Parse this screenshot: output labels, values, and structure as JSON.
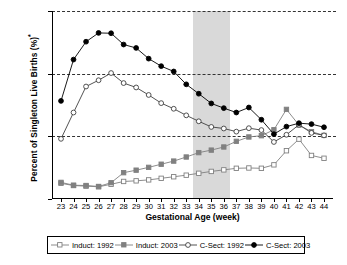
{
  "chart_data": {
    "type": "line",
    "title": "",
    "xlabel": "Gestational Age (week)",
    "ylabel": "Percent of Singleton Live Births (%)*",
    "ylabel_base": "Percent of Singleton Live Births (%)",
    "ylabel_footnote_marker": "*",
    "xlim": [
      23,
      44
    ],
    "ylim": [
      0,
      60
    ],
    "ytick_labels": [
      "0%",
      "20%",
      "40%",
      "60%"
    ],
    "ytick_values": [
      0,
      20,
      40,
      60
    ],
    "grid": "horizontal-dashed",
    "legend_position": "bottom",
    "categories": [
      23,
      24,
      25,
      26,
      27,
      28,
      29,
      30,
      31,
      32,
      33,
      34,
      35,
      36,
      37,
      38,
      39,
      40,
      41,
      42,
      43,
      44
    ],
    "xtick_labels": [
      "23",
      "24",
      "25",
      "26",
      "27",
      "28",
      "29",
      "30",
      "31",
      "32",
      "33",
      "34",
      "35",
      "36",
      "37",
      "38",
      "39",
      "40",
      "41",
      "42",
      "43",
      "44"
    ],
    "annotations": [
      {
        "name": "late-preterm-shaded-band",
        "type": "vertical-band",
        "x_start": 33.5,
        "x_end": 36.5,
        "color": "#d9d9d9"
      }
    ],
    "series": [
      {
        "name": "Induct: 1992",
        "marker": "open-square",
        "color": "#808080",
        "fill": "#ffffff",
        "values": [
          5.0,
          4.3,
          4.1,
          3.9,
          4.7,
          5.6,
          5.8,
          6.1,
          6.6,
          7.1,
          7.6,
          8.2,
          8.8,
          9.3,
          9.8,
          9.9,
          9.8,
          10.9,
          15.4,
          19.1,
          13.9,
          13.0
        ]
      },
      {
        "name": "Induct: 2003",
        "marker": "filled-square",
        "color": "#808080",
        "fill": "#808080",
        "values": [
          5.3,
          4.4,
          4.3,
          4.0,
          5.2,
          8.4,
          9.2,
          10.1,
          11.1,
          12.1,
          13.4,
          14.8,
          15.6,
          16.6,
          18.4,
          19.8,
          20.2,
          22.1,
          28.6,
          23.6,
          21.5,
          20.3
        ]
      },
      {
        "name": "C-Sect: 1992",
        "marker": "open-circle",
        "color": "#404040",
        "fill": "#ffffff",
        "values": [
          19.2,
          27.6,
          35.9,
          37.9,
          40.2,
          37.0,
          35.6,
          33.2,
          30.6,
          28.8,
          26.7,
          24.8,
          23.0,
          22.5,
          21.5,
          22.6,
          22.0,
          18.2,
          20.5,
          23.7,
          21.1,
          20.3
        ]
      },
      {
        "name": "C-Sect: 2003",
        "marker": "filled-circle",
        "color": "#000000",
        "fill": "#000000",
        "values": [
          31.3,
          44.5,
          50.2,
          53.0,
          52.9,
          49.3,
          48.2,
          44.8,
          42.4,
          40.7,
          36.6,
          33.6,
          30.5,
          29.0,
          27.6,
          29.2,
          25.3,
          20.7,
          23.1,
          24.2,
          23.9,
          22.9
        ]
      }
    ]
  },
  "legend": {
    "items": [
      {
        "label": "Induct: 1992",
        "marker": "open-square",
        "color": "#808080"
      },
      {
        "label": "Induct: 2003",
        "marker": "filled-square",
        "color": "#808080"
      },
      {
        "label": "C-Sect: 1992",
        "marker": "open-circle",
        "color": "#404040"
      },
      {
        "label": "C-Sect: 2003",
        "marker": "filled-circle",
        "color": "#000000"
      }
    ]
  }
}
